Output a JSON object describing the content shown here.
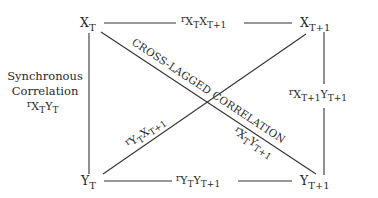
{
  "diagram": {
    "type": "cross-lagged panel correlation diagram",
    "nodes": {
      "x_t": {
        "main": "X",
        "sub": "T"
      },
      "x_t1": {
        "main": "X",
        "sub": "T+1"
      },
      "y_t": {
        "main": "Y",
        "sub": "T"
      },
      "y_t1": {
        "main": "Y",
        "sub": "T+1"
      }
    },
    "edges": {
      "top": {
        "r": "r",
        "a": "X",
        "a_sub": "T",
        "b": "X",
        "b_sub": "T+1"
      },
      "bottom": {
        "r": "r",
        "a": "Y",
        "a_sub": "T",
        "b": "Y",
        "b_sub": "T+1"
      },
      "left": {
        "r": "r",
        "a": "X",
        "a_sub": "T",
        "b": "Y",
        "b_sub": "T"
      },
      "right": {
        "r": "r",
        "a": "X",
        "a_sub": "T+1",
        "b": "Y",
        "b_sub": "T+1"
      },
      "diag_down": {
        "r": "r",
        "a": "X",
        "a_sub": "T",
        "b": "Y",
        "b_sub": "T+1"
      },
      "diag_up": {
        "r": "r",
        "a": "Y",
        "a_sub": "T",
        "b": "X",
        "b_sub": "T+1"
      }
    },
    "labels": {
      "synchronous_line1": "Synchronous",
      "synchronous_line2": "Correlation",
      "cross_lagged": "CROSS-LAGGED CORRELATION"
    },
    "colors": {
      "line": "#333333",
      "text": "#2a2a2a",
      "background": "#ffffff"
    }
  }
}
